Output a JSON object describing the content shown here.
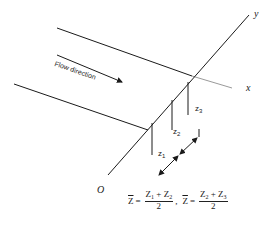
{
  "diagram": {
    "flow_label": "Flow direction",
    "axes": {
      "x": "x",
      "y": "y",
      "origin": "O"
    },
    "depth_labels": [
      {
        "base": "z",
        "sub": "1"
      },
      {
        "base": "z",
        "sub": "2"
      },
      {
        "base": "z",
        "sub": "3"
      }
    ],
    "formula": {
      "lhs1": "Z",
      "num1_a": "Z",
      "num1_a_sub": "1",
      "num1_plus": "+",
      "num1_b": "Z",
      "num1_b_sub": "2",
      "den1": "2",
      "sep": ",",
      "lhs2": "Z",
      "num2_a": "Z",
      "num2_a_sub": "2",
      "num2_plus": "+",
      "num2_b": "Z",
      "num2_b_sub": "3",
      "den2": "2",
      "eq": "="
    },
    "colors": {
      "line": "#1a1a1a",
      "faint": "#9a9a9a",
      "background": "#ffffff"
    }
  }
}
